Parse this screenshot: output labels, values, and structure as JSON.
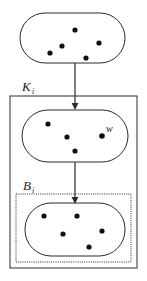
{
  "figure": {
    "width": 147,
    "height": 281,
    "background": "#ffffff",
    "stroke_color": "#2b2b2b",
    "dot_color": "#111111",
    "labels": {
      "k_main": "K",
      "k_sub": "i",
      "b_main": "B",
      "b_sub": "i",
      "w": "w"
    },
    "shapes": {
      "top_stadium": {
        "name": "top-stadium",
        "x": 20,
        "y": 13,
        "width": 105,
        "height": 50,
        "radius": 25,
        "dots": [
          {
            "cx": 75,
            "cy": 30,
            "r": 2.6
          },
          {
            "cx": 62,
            "cy": 46,
            "r": 2.6
          },
          {
            "cx": 99,
            "cy": 43,
            "r": 2.6
          },
          {
            "cx": 50,
            "cy": 53,
            "r": 2.6
          },
          {
            "cx": 86,
            "cy": 58,
            "r": 2.6
          }
        ]
      },
      "outer_rect": {
        "name": "outer-rectangle-k",
        "x": 10,
        "y": 96,
        "width": 127,
        "height": 172
      },
      "middle_stadium": {
        "name": "middle-stadium",
        "x": 22,
        "y": 110,
        "width": 106,
        "height": 52,
        "radius": 26,
        "dots": [
          {
            "cx": 48,
            "cy": 124,
            "r": 2.6
          },
          {
            "cx": 67,
            "cy": 137,
            "r": 2.6
          },
          {
            "cx": 75,
            "cy": 151,
            "r": 2.6
          },
          {
            "cx": 105,
            "cy": 136,
            "r": 2.6
          }
        ]
      },
      "dotted_rect": {
        "name": "dotted-rectangle-b",
        "x": 16,
        "y": 194,
        "width": 115,
        "height": 68
      },
      "bottom_stadium": {
        "name": "bottom-stadium",
        "x": 25,
        "y": 203,
        "width": 100,
        "height": 53,
        "radius": 26,
        "dots": [
          {
            "cx": 44,
            "cy": 216,
            "r": 2.6
          },
          {
            "cx": 77,
            "cy": 216,
            "r": 2.6
          },
          {
            "cx": 63,
            "cy": 234,
            "r": 2.6
          },
          {
            "cx": 102,
            "cy": 231,
            "r": 2.6
          },
          {
            "cx": 89,
            "cy": 247,
            "r": 2.6
          }
        ]
      },
      "w_dot": {
        "cx": 102,
        "cy": 136,
        "r": 2.8
      }
    },
    "arrows": [
      {
        "name": "arrow-top-to-middle",
        "x1": 75,
        "y1": 63,
        "x2": 75,
        "y2": 109
      },
      {
        "name": "arrow-middle-to-bottom",
        "x1": 75,
        "y1": 162,
        "x2": 75,
        "y2": 203
      }
    ],
    "label_positions": {
      "k": {
        "x": 22,
        "y": 91
      },
      "b": {
        "x": 23,
        "y": 190
      },
      "w": {
        "x": 106,
        "y": 132
      }
    }
  }
}
